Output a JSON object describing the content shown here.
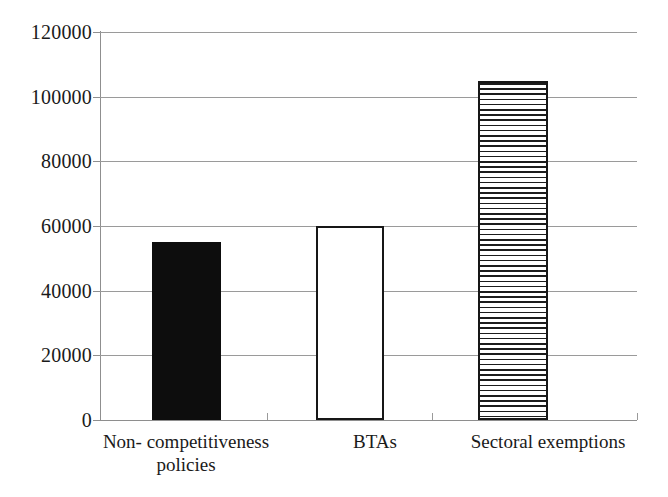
{
  "chart_data": {
    "type": "bar",
    "title": "",
    "subtitle": "",
    "xlabel": "",
    "ylabel": "",
    "categories": [
      "Non- competitiveness policies",
      "BTAs",
      "Sectoral exemptions"
    ],
    "category_lines": [
      [
        "Non- competitiveness",
        "policies"
      ],
      [
        "BTAs"
      ],
      [
        "Sectoral exemptions"
      ]
    ],
    "values": [
      55000,
      60000,
      105000
    ],
    "ylim": [
      0,
      120000
    ],
    "yticks": [
      0,
      20000,
      40000,
      60000,
      80000,
      100000,
      120000
    ],
    "ytick_labels": [
      "0",
      "20000",
      "40000",
      "60000",
      "80000",
      "100000",
      "120000"
    ],
    "grid": true,
    "grid_axis": "y",
    "legend": false,
    "legend_position": "none",
    "bar_styles": [
      "solid-black",
      "outline-white",
      "hatch-horizontal"
    ],
    "colors": {
      "bar_solid": "#0d0d0d",
      "bar_outline": "#171717",
      "bar_fill_white": "#ffffff",
      "hatch_line": "#1c1c1c",
      "gridline": "#9a9a9a",
      "axis": "#8f8f8f",
      "text": "#1a1a1a",
      "background": "#ffffff"
    }
  }
}
